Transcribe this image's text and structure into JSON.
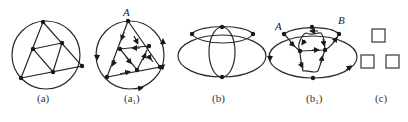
{
  "figure": {
    "panels": [
      {
        "id": "a",
        "label": "(a)",
        "description": "circle with inscribed triangle subdivided into four triangles"
      },
      {
        "id": "a1",
        "label": "(a",
        "label_sub": "1",
        "label_close": ")",
        "vertex_label": "A",
        "description": "directed Euler circuit on graph (a) starting at A"
      },
      {
        "id": "b",
        "label": "(b)",
        "description": "ellipse with inner top ellipse and vertical ellipse"
      },
      {
        "id": "b1",
        "label": "(b",
        "label_sub": "1",
        "label_close": ")",
        "vertex_labels": [
          "A",
          "B"
        ],
        "description": "directed Euler path on graph (b) from A to B"
      },
      {
        "id": "c",
        "label": "(c)",
        "description": "three small squares"
      }
    ],
    "colors": {
      "line": "#2a2a2a",
      "vertex": "#1a1a1a",
      "text": "#333333",
      "background": "#ffffff"
    }
  }
}
